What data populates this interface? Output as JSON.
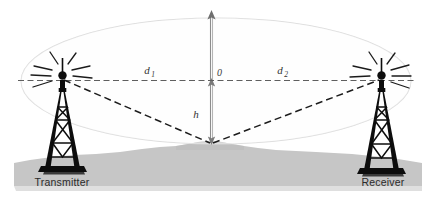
{
  "figure": {
    "background_color": "#ffffff"
  },
  "labels": {
    "transmitter": "Transmitter",
    "receiver": "Receiver",
    "distance_left": "d",
    "distance_left_sub": "1",
    "distance_right": "d",
    "distance_right_sub": "2",
    "origin": "0",
    "height": "h"
  },
  "icons": {
    "transmitter_tower": "transmitter-tower-icon",
    "receiver_tower": "receiver-tower-icon",
    "radiation_burst_left": "radiation-burst-icon",
    "radiation_burst_right": "radiation-burst-icon",
    "vertical_axis_arrow": "up-arrow-icon",
    "height_arrow": "double-arrow-icon"
  },
  "colors": {
    "terrain": "#c6c6c6",
    "terrain_shadow": "#b4b4b4",
    "fresnel_ellipse": "#d8d8d8",
    "line_of_sight": "#6e6e6e",
    "reflected_ray": "#1c1c1c",
    "tower": "#111111",
    "axis": "#8a8a8a",
    "label_text": "#2b2b2b"
  },
  "geometry": {
    "transmitter_antenna": {
      "x": 62,
      "y": 78
    },
    "receiver_antenna": {
      "x": 381,
      "y": 78
    },
    "reflection_point": {
      "x": 211,
      "y": 143
    },
    "axis_top": {
      "x": 211,
      "y": 12
    },
    "los_y": 80,
    "ellipse_center": {
      "x": 216,
      "y": 81
    },
    "ellipse_rx": 195,
    "ellipse_ry": 63
  }
}
